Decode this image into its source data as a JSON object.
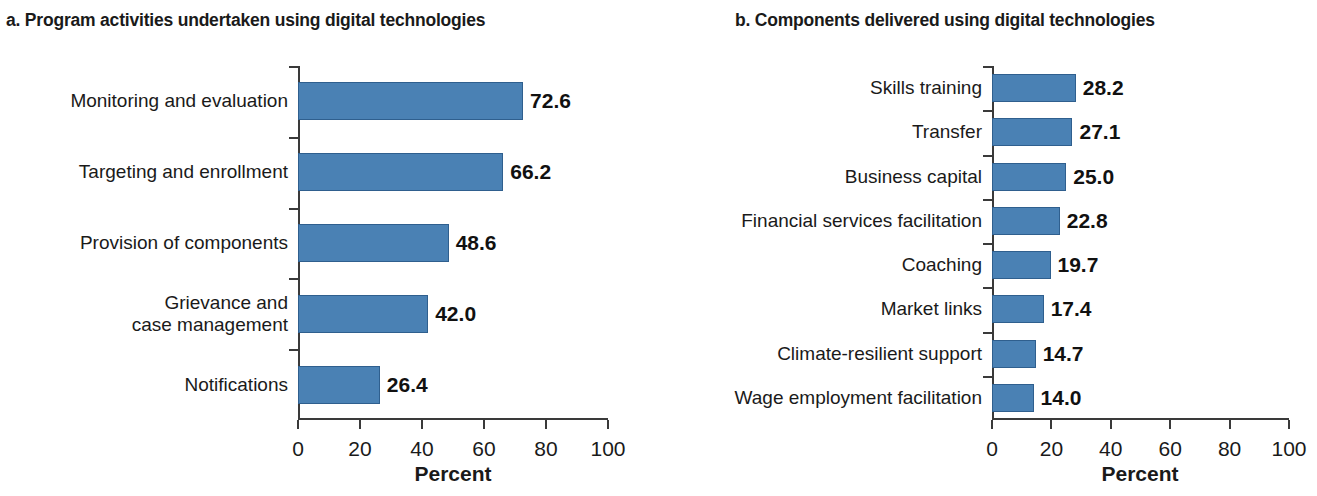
{
  "chart_data": [
    {
      "type": "bar",
      "orientation": "horizontal",
      "title": "a. Program activities undertaken using digital technologies",
      "panel_letter": "a.",
      "xlabel": "Percent",
      "ylabel": "",
      "xlim": [
        0,
        100
      ],
      "xticks": [
        0,
        20,
        40,
        60,
        80,
        100
      ],
      "xtick_labels": [
        "0",
        "20",
        "40",
        "60",
        "80",
        "100"
      ],
      "grid": false,
      "legend": "none",
      "bar_color": "#4a81b4",
      "bar_edge_color": "#2f5f8e",
      "categories": [
        "Monitoring and evaluation",
        "Targeting and enrollment",
        "Provision of components",
        "Grievance and\ncase management",
        "Notifications"
      ],
      "values": [
        72.6,
        66.2,
        48.6,
        42.0,
        26.4
      ],
      "value_labels": [
        "72.6",
        "66.2",
        "48.6",
        "42.0",
        "26.4"
      ]
    },
    {
      "type": "bar",
      "orientation": "horizontal",
      "title": "b. Components delivered using digital technologies",
      "panel_letter": "b.",
      "xlabel": "Percent",
      "ylabel": "",
      "xlim": [
        0,
        100
      ],
      "xticks": [
        0,
        20,
        40,
        60,
        80,
        100
      ],
      "xtick_labels": [
        "0",
        "20",
        "40",
        "60",
        "80",
        "100"
      ],
      "grid": false,
      "legend": "none",
      "bar_color": "#4a81b4",
      "bar_edge_color": "#2f5f8e",
      "categories": [
        "Skills training",
        "Transfer",
        "Business capital",
        "Financial services facilitation",
        "Coaching",
        "Market links",
        "Climate-resilient support",
        "Wage employment facilitation"
      ],
      "values": [
        28.2,
        27.1,
        25.0,
        22.8,
        19.7,
        17.4,
        14.7,
        14.0
      ],
      "value_labels": [
        "28.2",
        "27.1",
        "25.0",
        "22.8",
        "19.7",
        "17.4",
        "14.7",
        "14.0"
      ]
    }
  ]
}
